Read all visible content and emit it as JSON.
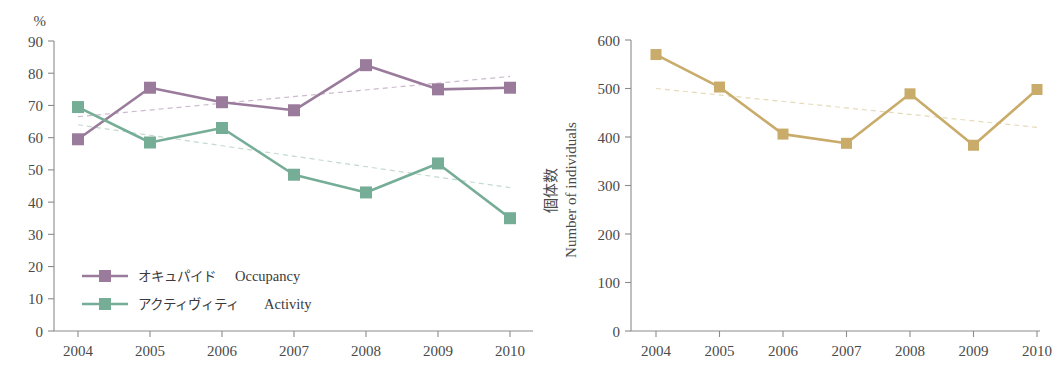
{
  "figure": {
    "background": "#ffffff",
    "panels": [
      "occupancy-activity-percent",
      "number-of-individuals"
    ]
  },
  "colors": {
    "occupancy": "#9a7b9c",
    "activity": "#76ad97",
    "individuals": "#c9ab6a",
    "occupancy_trend": "#c3aec4",
    "activity_trend": "#b9d3c8",
    "individuals_trend": "#e2d3ad",
    "axis": "#8b8b8b",
    "text": "#4a4a4a"
  },
  "left_panel": {
    "unit_label": "%",
    "legend": [
      {
        "key": "occupancy",
        "jp": "オキュパイド",
        "en": "Occupancy",
        "color": "#9a7b9c"
      },
      {
        "key": "activity",
        "jp": "アクティヴィティ",
        "en": "Activity",
        "color": "#76ad97"
      }
    ]
  },
  "right_panel": {
    "axis_title_jp": "個体数",
    "axis_title_en": "Number of individuals"
  },
  "chart_data": [
    {
      "id": "occupancy-activity-percent",
      "type": "line",
      "title": "",
      "xlabel": "",
      "ylabel": "%",
      "x": [
        "2004",
        "2005",
        "2006",
        "2007",
        "2008",
        "2009",
        "2010"
      ],
      "categories": [
        "2004",
        "2005",
        "2006",
        "2007",
        "2008",
        "2009",
        "2010"
      ],
      "ylim": [
        0,
        90
      ],
      "yticks": [
        0,
        10,
        20,
        30,
        40,
        50,
        60,
        70,
        80,
        90
      ],
      "ytick_labels": [
        "0",
        "10",
        "20",
        "30",
        "40",
        "50",
        "60",
        "70",
        "80",
        "90"
      ],
      "grid": false,
      "legend_position": "inside-bottom-left",
      "marker": "square",
      "series": [
        {
          "name": "オキュパイド  Occupancy",
          "name_jp": "オキュパイド",
          "name_en": "Occupancy",
          "color": "#9a7b9c",
          "values": [
            59.5,
            75.5,
            71.0,
            68.5,
            82.5,
            75.0,
            75.5
          ],
          "trend": {
            "style": "dashed",
            "color": "#c3aec4",
            "from": [
              2004,
              66.5
            ],
            "to": [
              2010,
              79.0
            ]
          }
        },
        {
          "name": "アクティヴィティ  Activity",
          "name_jp": "アクティヴィティ",
          "name_en": "Activity",
          "color": "#76ad97",
          "values": [
            69.5,
            58.5,
            63.0,
            48.5,
            43.0,
            52.0,
            35.0
          ],
          "trend": {
            "style": "dashed",
            "color": "#b9d3c8",
            "from": [
              2004,
              64.0
            ],
            "to": [
              2010,
              44.5
            ]
          }
        }
      ]
    },
    {
      "id": "number-of-individuals",
      "type": "line",
      "title": "",
      "xlabel": "",
      "ylabel": "個体数 / Number of individuals",
      "x": [
        "2004",
        "2005",
        "2006",
        "2007",
        "2008",
        "2009",
        "2010"
      ],
      "categories": [
        "2004",
        "2005",
        "2006",
        "2007",
        "2008",
        "2009",
        "2010"
      ],
      "ylim": [
        0,
        600
      ],
      "yticks": [
        0,
        100,
        200,
        300,
        400,
        500,
        600
      ],
      "ytick_labels": [
        "0",
        "100",
        "200",
        "300",
        "400",
        "500",
        "600"
      ],
      "grid": false,
      "legend_position": "none",
      "marker": "square",
      "series": [
        {
          "name": "Number of individuals",
          "color": "#c9ab6a",
          "values": [
            570,
            503,
            406,
            387,
            489,
            383,
            498
          ],
          "trend": {
            "style": "dashed",
            "color": "#e2d3ad",
            "from": [
              2004,
              500
            ],
            "to": [
              2010,
              420
            ]
          }
        }
      ]
    }
  ]
}
